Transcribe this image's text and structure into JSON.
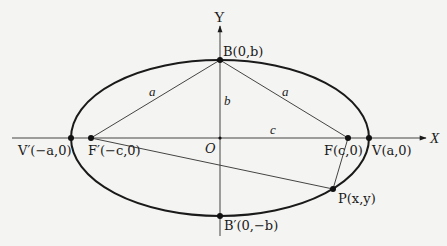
{
  "diagram": {
    "colors": {
      "background": "#f4f4f2",
      "stroke": "#1a1a1a",
      "thin": "#444444"
    },
    "axes": {
      "x_label": "X",
      "y_label": "Y",
      "origin_label": "O"
    },
    "ellipse": {
      "cx": 220,
      "cy": 138,
      "rx": 149,
      "ry": 78
    },
    "points": {
      "B": {
        "label": "B(0,b)",
        "x": 220,
        "y": 60
      },
      "Bp": {
        "label": "B′(0,−b)",
        "x": 220,
        "y": 216
      },
      "V": {
        "label": "V(a,0)",
        "x": 369,
        "y": 138
      },
      "Vp": {
        "label": "V′(−a,0)",
        "x": 71,
        "y": 138
      },
      "F": {
        "label": "F(c,0)",
        "x": 348,
        "y": 138
      },
      "Fp": {
        "label": "F′(−c,0)",
        "x": 91,
        "y": 138
      },
      "P": {
        "label": "P(x,y)",
        "x": 333,
        "y": 189
      },
      "O": {
        "label": "O",
        "x": 220,
        "y": 138
      }
    },
    "segment_labels": {
      "left_a": "a",
      "right_a": "a",
      "b": "b",
      "c": "c"
    }
  }
}
